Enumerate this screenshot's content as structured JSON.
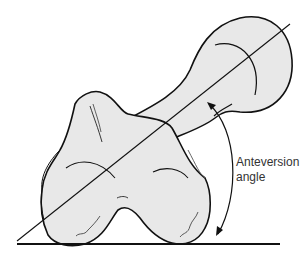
{
  "diagram": {
    "label_line1": "Anteversion",
    "label_line2": "angle",
    "colors": {
      "bone_fill": "#e8e8e8",
      "outline": "#111111",
      "background": "#ffffff",
      "text": "#333333"
    }
  }
}
